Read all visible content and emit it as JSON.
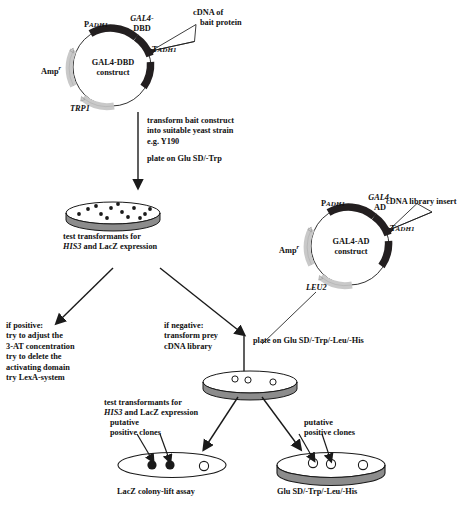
{
  "diagram": {
    "title_semantic": "yeast-two-hybrid-screening-workflow",
    "plasmid_bait": {
      "center_label_line1": "GAL4-DBD",
      "center_label_line2": "construct",
      "promoter_label_main": "P",
      "promoter_label_sub": "ADH1",
      "gene_label_line1": "GAL4-",
      "gene_label_line2": "DBD",
      "terminator_label_main": "T",
      "terminator_label_sub": "ADH1",
      "insert_label_line1": "cDNA of",
      "insert_label_line2": "bait protein",
      "marker_amp_main": "Amp",
      "marker_amp_sup": "r",
      "marker_selection": "TRP1"
    },
    "plasmid_prey": {
      "center_label_line1": "GAL4-AD",
      "center_label_line2": "construct",
      "promoter_label_main": "P",
      "promoter_label_sub": "ADH1",
      "gene_label_line1": "GAL4-",
      "gene_label_line2": "AD",
      "terminator_label_main": "T",
      "terminator_label_sub": "ADH1",
      "insert_label": "cDNA library insert",
      "marker_amp_main": "Amp",
      "marker_amp_sup": "r",
      "marker_selection": "LEU2"
    },
    "steps": {
      "transform_bait": "transform bait construct\ninto suitable yeast strain\ne.g. Y190",
      "plate_trp": "plate on Glu SD/-Trp",
      "test_transformants_1_line1": "test transformants for",
      "test_transformants_1_line2_italic": "HIS3",
      "test_transformants_1_line2_rest": " and LacZ expression",
      "if_positive": "if positive:\ntry to adjust the\n3-AT concentration\ntry to delete the\nactivating domain\ntry LexA-system",
      "if_negative": "if negative:\ntransform prey\ncDNA library",
      "plate_triple": "plate on Glu SD/-Trp/-Leu/-His",
      "test_transformants_2_line1": "test transformants for",
      "test_transformants_2_line2_italic": "HIS3",
      "test_transformants_2_line2_rest": " and LacZ expression",
      "putative_left": "putative\npositive clones",
      "putative_right": "putative\npositive clones",
      "plate_label_left": "LacZ colony-lift assay",
      "plate_label_right": "Glu SD/-Trp/-Leu/-His"
    },
    "colors": {
      "dark_segment": "#231f20",
      "light_segment": "#c9c9c9",
      "plate_rim": "#8c8c8c",
      "plate_top": "#ffffff",
      "line": "#1a1a1a",
      "colony_filled": "#1a1a1a"
    }
  }
}
